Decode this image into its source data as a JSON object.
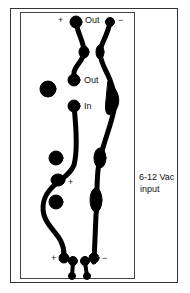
{
  "diagram": {
    "type": "pcb-trace-layout",
    "trace_color": "#000000",
    "background": "#ffffff",
    "labels": {
      "top_plus": "+",
      "top_out": "Out",
      "top_minus": "−",
      "mid_out": "Out",
      "in": "In",
      "mid_plus": "+",
      "bottom_plus": "+",
      "bottom_minus": "−",
      "supply_line1": "6-12 Vac",
      "supply_line2": "input"
    }
  }
}
